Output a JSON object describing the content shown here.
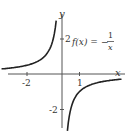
{
  "chart_data": {
    "type": "line",
    "title": "",
    "function_label": "f(x) = -1/x",
    "function_label_parts": {
      "lhs": "f(x) =",
      "sign": "−",
      "numerator": "1",
      "denominator": "x"
    },
    "xlabel": "x",
    "ylabel": "y",
    "x_ticks": [
      {
        "value": -2,
        "label": "-2"
      },
      {
        "value": 1,
        "label": "1"
      }
    ],
    "y_ticks": [
      {
        "value": 2,
        "label": "2"
      },
      {
        "value": -2,
        "label": "-2"
      }
    ],
    "xlim": [
      -3.5,
      3.8
    ],
    "ylim": [
      -3.7,
      3.5
    ],
    "grid": false,
    "series": [
      {
        "name": "f(x) = -1/x",
        "branch": "left",
        "x": [
          -3.4,
          -3,
          -2.5,
          -2,
          -1.5,
          -1,
          -0.75,
          -0.5,
          -0.4,
          -0.33,
          -0.3
        ],
        "y": [
          0.29,
          0.33,
          0.4,
          0.5,
          0.67,
          1,
          1.33,
          2,
          2.5,
          3.0,
          3.33
        ]
      },
      {
        "name": "f(x) = -1/x",
        "branch": "right",
        "x": [
          0.3,
          0.33,
          0.4,
          0.5,
          0.75,
          1,
          1.5,
          2,
          2.5,
          3,
          3.4
        ],
        "y": [
          -3.33,
          -3.0,
          -2.5,
          -2,
          -1.33,
          -1,
          -0.67,
          -0.5,
          -0.4,
          -0.33,
          -0.29
        ]
      }
    ],
    "colors": {
      "axis": "#444444",
      "curve": "#222222",
      "text": "#333333"
    }
  }
}
